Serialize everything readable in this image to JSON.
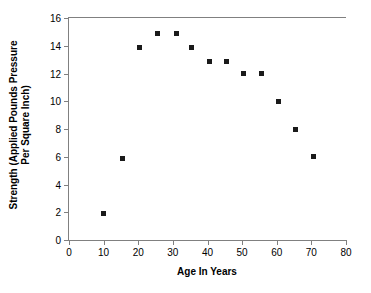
{
  "chart_data": {
    "type": "scatter",
    "title": "",
    "xlabel": "Age In Years",
    "ylabel": "Strength (Applied Pounds Pressure Per Square Inch)",
    "ylabel_line1": "Strength (Applied Pounds Pressure",
    "ylabel_line2": "Per Square Inch)",
    "xlim": [
      0,
      80
    ],
    "ylim": [
      0,
      16
    ],
    "xticks": [
      0,
      10,
      20,
      30,
      40,
      50,
      60,
      70,
      80
    ],
    "yticks": [
      0,
      2,
      4,
      6,
      8,
      10,
      12,
      14,
      16
    ],
    "grid": false,
    "legend": false,
    "marker": "square",
    "marker_color": "#1a1a1a",
    "x": [
      10,
      15.5,
      20.5,
      25.5,
      31,
      35.5,
      40.5,
      45.5,
      50.5,
      55.5,
      60.5,
      65.5,
      70.5
    ],
    "y": [
      1.9,
      5.9,
      13.9,
      14.9,
      14.9,
      13.9,
      12.9,
      12.9,
      12,
      12,
      10,
      8,
      6
    ],
    "points": [
      {
        "age": 10,
        "strength": 1.9
      },
      {
        "age": 15.5,
        "strength": 5.9
      },
      {
        "age": 20.5,
        "strength": 13.9
      },
      {
        "age": 25.5,
        "strength": 14.9
      },
      {
        "age": 31,
        "strength": 14.9
      },
      {
        "age": 35.5,
        "strength": 13.9
      },
      {
        "age": 40.5,
        "strength": 12.9
      },
      {
        "age": 45.5,
        "strength": 12.9
      },
      {
        "age": 50.5,
        "strength": 12
      },
      {
        "age": 55.5,
        "strength": 12
      },
      {
        "age": 60.5,
        "strength": 10
      },
      {
        "age": 65.5,
        "strength": 8
      },
      {
        "age": 70.5,
        "strength": 6
      }
    ]
  }
}
